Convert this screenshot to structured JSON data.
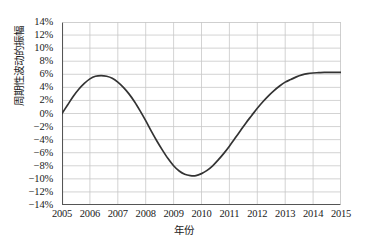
{
  "chart_data": {
    "type": "line",
    "title": "",
    "xlabel": "年份",
    "ylabel": "周期性波动的振幅",
    "xlim": [
      2005,
      2015
    ],
    "ylim": [
      -14,
      14
    ],
    "grid": true,
    "legend": false,
    "y_unit": "%",
    "x_ticks": [
      2005,
      2006,
      2007,
      2008,
      2009,
      2010,
      2011,
      2012,
      2013,
      2014,
      2015
    ],
    "x_tick_labels": [
      "2005",
      "2006",
      "2007",
      "2008",
      "2009",
      "2010",
      "2011",
      "2012",
      "2013",
      "2014",
      "2015"
    ],
    "y_ticks": [
      14,
      12,
      10,
      8,
      6,
      4,
      2,
      0,
      -2,
      -4,
      -6,
      -8,
      -10,
      -12,
      -14
    ],
    "y_tick_labels": [
      "14%",
      "12%",
      "10%",
      "8%",
      "6%",
      "4%",
      "2%",
      "0%",
      "-2%",
      "-4%",
      "-6%",
      "-8%",
      "-10%",
      "-12%",
      "-14%"
    ],
    "series": [
      {
        "name": "周期性波动的振幅",
        "color": "#333333",
        "x": [
          2005.0,
          2005.2,
          2005.4,
          2005.6,
          2005.8,
          2006.0,
          2006.2,
          2006.4,
          2006.6,
          2006.8,
          2007.0,
          2007.2,
          2007.4,
          2007.6,
          2007.8,
          2008.0,
          2008.2,
          2008.4,
          2008.6,
          2008.8,
          2009.0,
          2009.2,
          2009.4,
          2009.6,
          2009.8,
          2010.0,
          2010.2,
          2010.4,
          2010.6,
          2010.8,
          2011.0,
          2011.2,
          2011.4,
          2011.6,
          2011.8,
          2012.0,
          2012.2,
          2012.4,
          2012.6,
          2012.8,
          2013.0,
          2013.2,
          2013.4,
          2013.6,
          2013.8,
          2014.0,
          2014.2,
          2014.4,
          2014.6,
          2014.8,
          2015.0
        ],
        "values": [
          0.0,
          1.3,
          2.6,
          3.7,
          4.6,
          5.3,
          5.7,
          5.8,
          5.7,
          5.4,
          4.8,
          4.0,
          3.0,
          1.8,
          0.4,
          -1.1,
          -2.7,
          -4.2,
          -5.6,
          -6.9,
          -8.0,
          -8.8,
          -9.3,
          -9.5,
          -9.5,
          -9.2,
          -8.7,
          -8.0,
          -7.1,
          -6.1,
          -5.0,
          -3.8,
          -2.6,
          -1.4,
          -0.3,
          0.8,
          1.8,
          2.7,
          3.5,
          4.2,
          4.8,
          5.2,
          5.6,
          5.9,
          6.1,
          6.2,
          6.25,
          6.3,
          6.3,
          6.3,
          6.3
        ]
      }
    ],
    "annotations": {
      "peak": {
        "x": 2006.4,
        "y": 5.8
      },
      "trough": {
        "x": 2009.7,
        "y": -9.5
      },
      "start": {
        "x": 2005.0,
        "y": 0.0
      },
      "end": {
        "x": 2015.0,
        "y": 6.3
      }
    }
  },
  "style": {
    "grid_color": "#c8c8c8",
    "axis_color": "#555555",
    "curve_color": "#333333",
    "background": "#ffffff"
  }
}
